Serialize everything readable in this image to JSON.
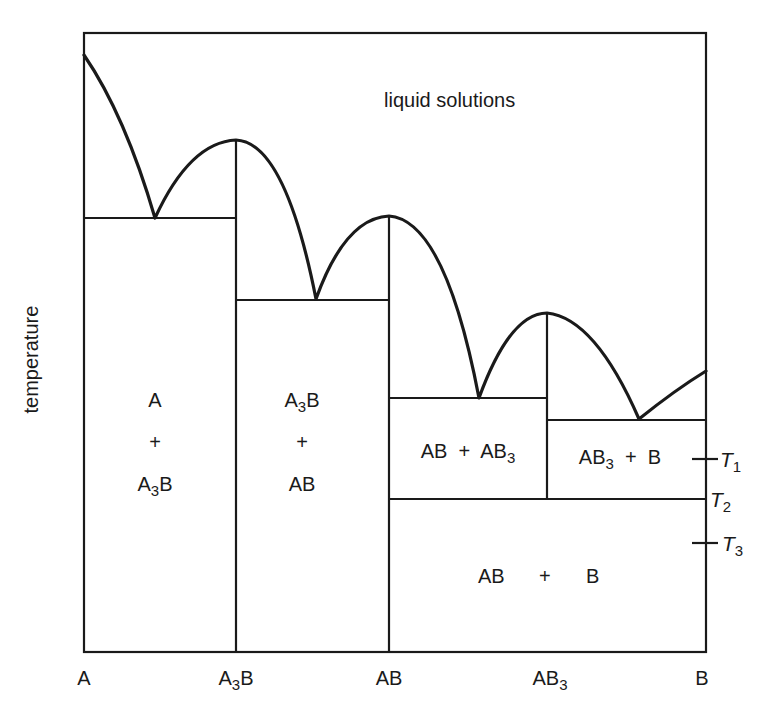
{
  "diagram": {
    "type": "binary phase diagram with intermediate compounds",
    "y_axis_label": "temperature",
    "x_axis_labels": [
      {
        "main": "A",
        "sub": "",
        "after": ""
      },
      {
        "main": "A",
        "sub": "3",
        "after": "B"
      },
      {
        "main": "AB",
        "sub": "",
        "after": ""
      },
      {
        "main": "AB",
        "sub": "3",
        "after": ""
      },
      {
        "main": "B",
        "sub": "",
        "after": ""
      }
    ],
    "region_labels": {
      "liquid": "liquid solutions",
      "a_a3b": {
        "line1": "A",
        "line2": "+",
        "line3_main": "A",
        "line3_sub": "3",
        "line3_after": "B"
      },
      "a3b_ab": {
        "line1_main": "A",
        "line1_sub": "3",
        "line1_after": "B",
        "line2": "+",
        "line3": "AB"
      },
      "ab_ab3": {
        "pre": "AB  +  AB",
        "sub": "3"
      },
      "ab3_b": {
        "pre": "AB",
        "sub": "3",
        "post": "  +  B"
      },
      "ab_b": {
        "left": "AB",
        "plus": "+",
        "right": "B"
      }
    },
    "temperature_marks": [
      {
        "letter": "T",
        "sub": "1"
      },
      {
        "letter": "T",
        "sub": "2"
      },
      {
        "letter": "T",
        "sub": "3"
      }
    ]
  }
}
